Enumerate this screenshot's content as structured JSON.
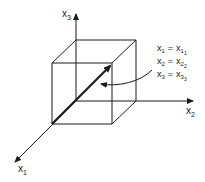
{
  "diagram": {
    "type": "3d-coordinate-axes-with-unit-cube",
    "axes": {
      "x1": {
        "label": "x",
        "subscript": "1"
      },
      "x2": {
        "label": "x",
        "subscript": "2"
      },
      "x3": {
        "label": "x",
        "subscript": "3"
      }
    },
    "annotation": {
      "lines": [
        {
          "lhs": "x",
          "lhs_sub": "1",
          "eq": "=",
          "rhs": "x",
          "rhs_sub": "1",
          "rhs_subsub": "1"
        },
        {
          "lhs": "x",
          "lhs_sub": "2",
          "eq": "=",
          "rhs": "x",
          "rhs_sub": "2",
          "rhs_subsub": "2"
        },
        {
          "lhs": "x",
          "lhs_sub": "3",
          "eq": "=",
          "rhs": "x",
          "rhs_sub": "3",
          "rhs_subsub": "3"
        }
      ]
    },
    "colors": {
      "line": "#1a1a1a",
      "background": "#ffffff"
    }
  }
}
